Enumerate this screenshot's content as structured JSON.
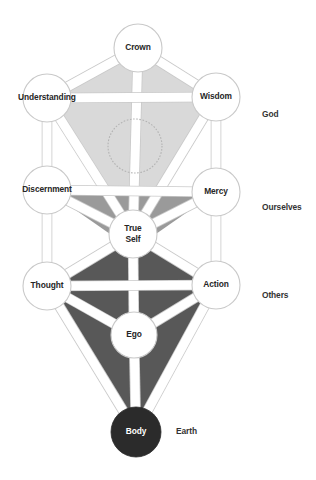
{
  "diagram": {
    "background_color": "#ffffff",
    "palette": {
      "region_upper": "#d9d9d9",
      "region_middle": "#9a9a9a",
      "region_lower": "#585858",
      "path_fill": "#ffffff",
      "path_stroke": "#c9c9c9",
      "node_fill": "#ffffff",
      "node_stroke": "#c9c9c9",
      "node_dark_fill": "#2b2b2b",
      "label_color": "#262626",
      "label_color_inverse": "#ffffff",
      "hidden_node_stroke": "#b3b3b3"
    },
    "nodes": [
      {
        "id": "crown",
        "label": "Crown",
        "lines": [
          "Crown"
        ],
        "cx": 138,
        "cy": 48,
        "r": 24,
        "style": "light"
      },
      {
        "id": "understanding",
        "label": "Understanding",
        "lines": [
          "Understanding"
        ],
        "cx": 47,
        "cy": 98,
        "r": 24,
        "style": "light"
      },
      {
        "id": "wisdom",
        "label": "Wisdom",
        "lines": [
          "Wisdom"
        ],
        "cx": 216,
        "cy": 97,
        "r": 24,
        "style": "light"
      },
      {
        "id": "knowledge",
        "label": "",
        "lines": [],
        "cx": 135,
        "cy": 146,
        "r": 27,
        "style": "hidden"
      },
      {
        "id": "discernment",
        "label": "Discernment",
        "lines": [
          "Discernment"
        ],
        "cx": 47,
        "cy": 190,
        "r": 24,
        "style": "light"
      },
      {
        "id": "mercy",
        "label": "Mercy",
        "lines": [
          "Mercy"
        ],
        "cx": 216,
        "cy": 192,
        "r": 24,
        "style": "light"
      },
      {
        "id": "true-self",
        "label": "True Self",
        "lines": [
          "True",
          "Self"
        ],
        "cx": 133,
        "cy": 234,
        "r": 24,
        "style": "light"
      },
      {
        "id": "thought",
        "label": "Thought",
        "lines": [
          "Thought"
        ],
        "cx": 47,
        "cy": 286,
        "r": 24,
        "style": "light"
      },
      {
        "id": "action",
        "label": "Action",
        "lines": [
          "Action"
        ],
        "cx": 216,
        "cy": 285,
        "r": 24,
        "style": "light"
      },
      {
        "id": "ego",
        "label": "Ego",
        "lines": [
          "Ego"
        ],
        "cx": 134,
        "cy": 335,
        "r": 23,
        "style": "light"
      },
      {
        "id": "body",
        "label": "Body",
        "lines": [
          "Body"
        ],
        "cx": 136,
        "cy": 432,
        "r": 25,
        "style": "dark"
      }
    ],
    "realm_labels": [
      {
        "id": "god",
        "text": "God",
        "x": 262,
        "y": 115
      },
      {
        "id": "ourselves",
        "text": "Ourselves",
        "x": 262,
        "y": 208
      },
      {
        "id": "others",
        "text": "Others",
        "x": 262,
        "y": 296
      },
      {
        "id": "earth",
        "text": "Earth",
        "x": 176,
        "y": 432
      }
    ],
    "paths": [
      {
        "from": "crown",
        "to": "understanding"
      },
      {
        "from": "crown",
        "to": "wisdom"
      },
      {
        "from": "crown",
        "to": "true-self"
      },
      {
        "from": "understanding",
        "to": "wisdom"
      },
      {
        "from": "understanding",
        "to": "discernment"
      },
      {
        "from": "understanding",
        "to": "true-self"
      },
      {
        "from": "wisdom",
        "to": "mercy"
      },
      {
        "from": "wisdom",
        "to": "true-self"
      },
      {
        "from": "discernment",
        "to": "mercy"
      },
      {
        "from": "discernment",
        "to": "true-self"
      },
      {
        "from": "discernment",
        "to": "thought"
      },
      {
        "from": "mercy",
        "to": "true-self"
      },
      {
        "from": "mercy",
        "to": "action"
      },
      {
        "from": "true-self",
        "to": "thought"
      },
      {
        "from": "true-self",
        "to": "action"
      },
      {
        "from": "true-self",
        "to": "ego"
      },
      {
        "from": "thought",
        "to": "action"
      },
      {
        "from": "thought",
        "to": "ego"
      },
      {
        "from": "thought",
        "to": "body"
      },
      {
        "from": "action",
        "to": "ego"
      },
      {
        "from": "action",
        "to": "body"
      },
      {
        "from": "ego",
        "to": "body"
      }
    ],
    "regions": [
      {
        "id": "upper-region",
        "tone": "region_upper",
        "points": "138,48 216,97 135,238 47,98"
      },
      {
        "id": "middle-region",
        "tone": "region_middle",
        "points": "47,190 216,192 133,250"
      },
      {
        "id": "lower-region",
        "tone": "region_lower",
        "points": "133,234 216,285 136,432 47,286"
      }
    ]
  }
}
